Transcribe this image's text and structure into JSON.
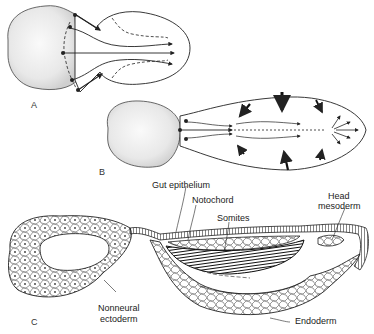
{
  "figure": {
    "panels": [
      {
        "id": "A",
        "label": "A",
        "description": "Dorsal view of early embryo showing convergent movements toward the midline"
      },
      {
        "id": "B",
        "label": "B",
        "description": "Later stage embryo with elongating axis and arrows indicating convergence and extension"
      },
      {
        "id": "C",
        "label": "C",
        "description": "Sagittal section showing tissue layers"
      }
    ],
    "labels": {
      "gut_epithelium": "Gut epithelium",
      "notochord": "Notochord",
      "somites": "Somites",
      "head_mesoderm_line1": "Head",
      "head_mesoderm_line2": "mesoderm",
      "nonneural_ectoderm_line1": "Nonneural",
      "nonneural_ectoderm_line2": "ectoderm",
      "endoderm": "Endoderm"
    },
    "colors": {
      "line": "#222222",
      "yolk_shading": "#e6e6e6",
      "background": "#ffffff"
    }
  }
}
